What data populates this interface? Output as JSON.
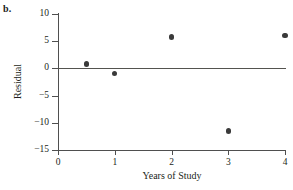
{
  "panel": {
    "label": "b."
  },
  "chart_data": {
    "type": "scatter",
    "title": "",
    "xlabel": "Years of Study",
    "ylabel": "Residual",
    "xlim": [
      0,
      4
    ],
    "ylim": [
      -15,
      10
    ],
    "xticks": [
      0,
      1,
      2,
      3,
      4
    ],
    "xtick_labels": [
      "0",
      "1",
      "2",
      "3",
      "4"
    ],
    "yticks": [
      10,
      5,
      0,
      -5,
      -10,
      -15
    ],
    "ytick_labels": [
      "10",
      "5",
      "0",
      "−5",
      "−10",
      "−15"
    ],
    "grid": false,
    "legend": null,
    "reference_line": {
      "y": 0,
      "color": "#54534f"
    },
    "marker_color": "#3a3a3a",
    "points": [
      {
        "x": 0.5,
        "y": 0.8
      },
      {
        "x": 1.0,
        "y": -0.9
      },
      {
        "x": 2.0,
        "y": 5.8
      },
      {
        "x": 3.0,
        "y": -11.5
      },
      {
        "x": 4.0,
        "y": 6.1
      }
    ]
  }
}
